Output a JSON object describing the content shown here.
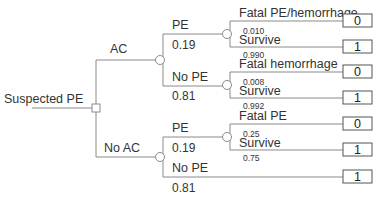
{
  "root": {
    "label": "Suspected PE",
    "node_type": "decision"
  },
  "branches": {
    "ac": {
      "label": "AC",
      "pe": {
        "label": "PE",
        "prob": "0.19",
        "outcomes": [
          {
            "label": "Fatal PE/hemorrhage",
            "prob": "0.010",
            "value": "0"
          },
          {
            "label": "Survive",
            "prob": "0.990",
            "value": "1"
          }
        ]
      },
      "no_pe": {
        "label": "No PE",
        "prob": "0.81",
        "outcomes": [
          {
            "label": "Fatal hemorrhage",
            "prob": "0.008",
            "value": "0"
          },
          {
            "label": "Survive",
            "prob": "0.992",
            "value": "1"
          }
        ]
      }
    },
    "no_ac": {
      "label": "No AC",
      "pe": {
        "label": "PE",
        "prob": "0.19",
        "outcomes": [
          {
            "label": "Fatal PE",
            "prob": "0.25",
            "value": "0"
          },
          {
            "label": "Survive",
            "prob": "0.75",
            "value": "1"
          }
        ]
      },
      "no_pe": {
        "label": "No PE",
        "prob": "0.81",
        "value": "1"
      }
    }
  }
}
